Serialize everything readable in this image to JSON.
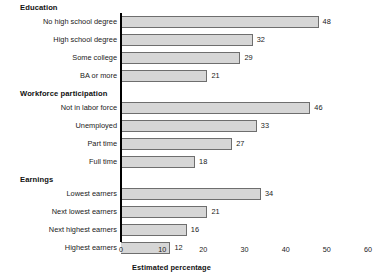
{
  "chart_data": {
    "type": "bar",
    "orientation": "horizontal",
    "title": "",
    "xlabel": "Estimated percentage",
    "ylabel": "",
    "xlim": [
      0,
      60
    ],
    "xticks": [
      0,
      10,
      20,
      30,
      40,
      50,
      60
    ],
    "xtick_labels": [
      "0",
      "10",
      "20",
      "30",
      "40",
      "50",
      "60"
    ],
    "grid": false,
    "legend": null,
    "show_value_labels": true,
    "bar_fill_color": "#d6d6d6",
    "bar_edge_color": "#6e6e6e",
    "axis_color": "#000000",
    "background_color": "#ffffff",
    "groups": [
      {
        "name": "Education",
        "categories": [
          "No high school degree",
          "High school degree",
          "Some college",
          "BA or more"
        ],
        "values": [
          48,
          32,
          29,
          21
        ]
      },
      {
        "name": "Workforce participation",
        "categories": [
          "Not in labor force",
          "Unemployed",
          "Part time",
          "Full time"
        ],
        "values": [
          46,
          33,
          27,
          18
        ]
      },
      {
        "name": "Earnings",
        "categories": [
          "Lowest earners",
          "Next lowest earners",
          "Next highest earners",
          "Highest earners"
        ],
        "values": [
          34,
          21,
          16,
          12
        ]
      }
    ],
    "categories": [
      "No high school degree",
      "High school degree",
      "Some college",
      "BA or more",
      "Not in labor force",
      "Unemployed",
      "Part time",
      "Full time",
      "Lowest earners",
      "Next lowest earners",
      "Next highest earners",
      "Highest earners"
    ],
    "values": [
      48,
      32,
      29,
      21,
      46,
      33,
      27,
      18,
      34,
      21,
      16,
      12
    ]
  }
}
